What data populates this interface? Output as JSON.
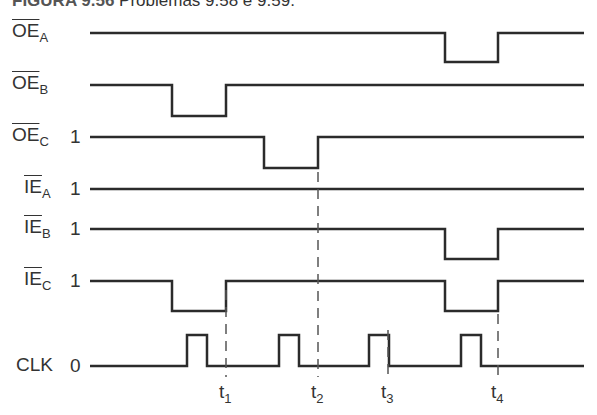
{
  "caption": {
    "figure": "FIGURA 9.56",
    "text": "Problemas 9.58 e 9.59."
  },
  "signals": [
    {
      "name": "OE",
      "sub": "A",
      "overbar": true,
      "level": "",
      "y_high": 33,
      "y_low": 62,
      "low_intervals": [
        [
          445,
          498
        ]
      ]
    },
    {
      "name": "OE",
      "sub": "B",
      "overbar": true,
      "level": "",
      "y_high": 85,
      "y_low": 116,
      "low_intervals": [
        [
          172,
          226
        ]
      ]
    },
    {
      "name": "OE",
      "sub": "C",
      "overbar": true,
      "level": "1",
      "y_high": 137,
      "y_low": 168,
      "low_intervals": [
        [
          264,
          318
        ]
      ]
    },
    {
      "name": "IE",
      "sub": "A",
      "overbar": true,
      "level": "1",
      "y_high": 189,
      "y_low": 189,
      "low_intervals": []
    },
    {
      "name": "IE",
      "sub": "B",
      "overbar": true,
      "level": "1",
      "y_high": 229,
      "y_low": 259,
      "low_intervals": [
        [
          445,
          498
        ]
      ]
    },
    {
      "name": "IE",
      "sub": "C",
      "overbar": true,
      "level": "1",
      "y_high": 281,
      "y_low": 311,
      "low_intervals": [
        [
          172,
          226
        ],
        [
          445,
          498
        ]
      ]
    },
    {
      "name": "CLK",
      "sub": "",
      "overbar": false,
      "level": "0",
      "y_high": 335,
      "y_low": 366,
      "high_intervals": [
        [
          187,
          207
        ],
        [
          279,
          299
        ],
        [
          369,
          389
        ],
        [
          461,
          481
        ]
      ]
    }
  ],
  "time_markers": [
    {
      "label": "t",
      "sub": "1",
      "x": 226
    },
    {
      "label": "t",
      "sub": "2",
      "x": 318
    },
    {
      "label": "t",
      "sub": "3",
      "x": 388
    },
    {
      "label": "t",
      "sub": "4",
      "x": 498
    }
  ],
  "colors": {
    "line": "#2b2b2b",
    "dash": "#555555",
    "text": "#333333"
  }
}
